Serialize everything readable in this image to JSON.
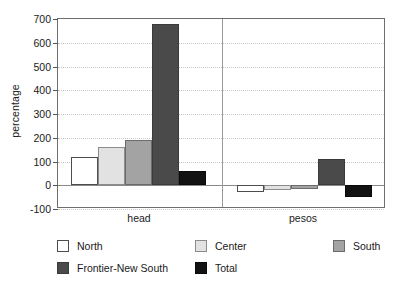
{
  "chart_data": {
    "type": "bar",
    "title": "",
    "xlabel": "",
    "ylabel": "percentage",
    "ylim": [
      -100,
      700
    ],
    "yticks": [
      700,
      600,
      500,
      400,
      300,
      200,
      100,
      0,
      -100
    ],
    "ytick_labels": [
      "700",
      "600",
      "500",
      "400",
      "300",
      "200",
      "100",
      "0",
      "-100"
    ],
    "grid": true,
    "grid_style": "dotted-horizontal",
    "legend_position": "bottom-left",
    "categories": [
      "head",
      "pesos"
    ],
    "series": [
      {
        "name": "North",
        "color": "#ffffff",
        "values": [
          120,
          -28
        ]
      },
      {
        "name": "Center",
        "color": "#e2e2e2",
        "values": [
          163,
          -20
        ]
      },
      {
        "name": "South",
        "color": "#a3a3a3",
        "values": [
          192,
          -15
        ]
      },
      {
        "name": "Frontier-New South",
        "color": "#4a4a4a",
        "values": [
          680,
          110
        ]
      },
      {
        "name": "Total",
        "color": "#121212",
        "values": [
          60,
          -50
        ]
      }
    ]
  },
  "legend": {
    "items": [
      {
        "label": "North"
      },
      {
        "label": "Center"
      },
      {
        "label": "South"
      },
      {
        "label": "Frontier-New South"
      },
      {
        "label": "Total"
      }
    ]
  }
}
